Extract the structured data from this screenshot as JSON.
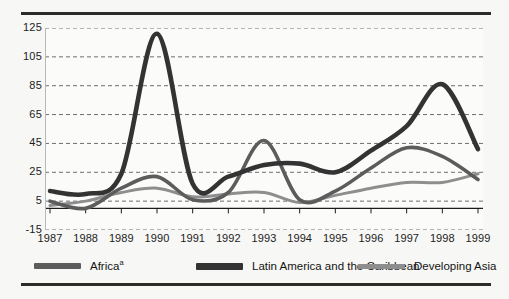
{
  "chart_data": {
    "type": "line",
    "title": "",
    "subtitle": "",
    "xlabel": "",
    "ylabel": "",
    "grid": true,
    "legend_position": "bottom",
    "x": [
      1987,
      1988,
      1989,
      1990,
      1991,
      1992,
      1993,
      1994,
      1995,
      1996,
      1997,
      1998,
      1999
    ],
    "categories": [
      "1987",
      "1988",
      "1989",
      "1990",
      "1991",
      "1992",
      "1993",
      "1994",
      "1995",
      "1996",
      "1997",
      "1998",
      "1999"
    ],
    "ylim": [
      -15,
      125
    ],
    "yticks": [
      125,
      105,
      85,
      65,
      45,
      25,
      5,
      -15
    ],
    "ytick_labels": [
      "125",
      "105",
      "85",
      "65",
      "45",
      "25",
      "5",
      "-15"
    ],
    "zero_line": 0,
    "series": [
      {
        "name": "Africa",
        "label": "Africa",
        "superscript": "a",
        "color": "#5c5c5c",
        "width": 3.6,
        "values": [
          5,
          0,
          14,
          22,
          6,
          11,
          47,
          6,
          12,
          28,
          42,
          36,
          20
        ]
      },
      {
        "name": "Latin America and the Caribbean",
        "label": "Latin America and the Caribbean",
        "superscript": "",
        "color": "#333333",
        "width": 4.6,
        "values": [
          12,
          10,
          24,
          121,
          17,
          22,
          30,
          31,
          25,
          40,
          57,
          86,
          41
        ]
      },
      {
        "name": "Developing Asia",
        "label": "Developing Asia",
        "superscript": "",
        "color": "#8e8e8e",
        "width": 3.0,
        "values": [
          2,
          5,
          11,
          14,
          8,
          10,
          11,
          4,
          9,
          14,
          18,
          18,
          24
        ]
      }
    ]
  },
  "legend": {
    "items": [
      {
        "label": "Africa",
        "superscript": "a",
        "color": "#5c5c5c",
        "thickness": 6
      },
      {
        "label": "Latin America and the Caribbean",
        "superscript": "",
        "color": "#333333",
        "thickness": 7
      },
      {
        "label": "Developing Asia",
        "superscript": "",
        "color": "#8e8e8e",
        "thickness": 5
      }
    ]
  },
  "colors": {
    "background": "#f7f7f5",
    "plot_background": "#fbfbfa",
    "rule": "#2b2b2b",
    "gridline": "#6e6e6e",
    "axis": "#1c1c1c",
    "text": "#1c1c1c"
  }
}
